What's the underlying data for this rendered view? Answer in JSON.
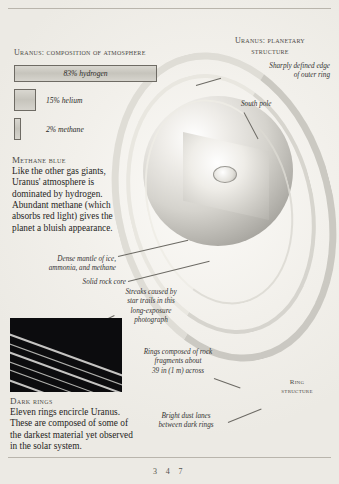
{
  "page": {
    "number": "3 4 7"
  },
  "composition": {
    "title": "Uranus: composition of atmosphere",
    "bars": [
      {
        "label": "83% hydrogen",
        "percent": 83,
        "placement": "inside"
      },
      {
        "label": "15% helium",
        "percent": 15,
        "placement": "outside"
      },
      {
        "label": "2% methane",
        "percent": 2,
        "placement": "outside"
      }
    ]
  },
  "methane_blue": {
    "heading": "Methane blue",
    "body": "Like the other gas giants, Uranus' atmosphere is dominated by hydrogen. Abundant methane (which absorbs red light) gives the planet a bluish appearance."
  },
  "structure": {
    "title_line1": "Uranus: planetary",
    "title_line2": "structure"
  },
  "ring_structure": {
    "title_line1": "Ring",
    "title_line2": "structure"
  },
  "annotations": {
    "outer_ring_edge": "Sharply defined edge\nof outer ring",
    "south_pole": "South pole",
    "mantle": "Dense mantle of ice,\nammonia, and methane",
    "core": "Solid rock core",
    "star_trails": "Streaks caused by\nstar trails in this\nlong-exposure\nphotograph",
    "ring_fragments": "Rings composed of rock\nfragments about\n39 in (1 m) across",
    "dust_lanes": "Bright dust lanes\nbetween dark rings"
  },
  "dark_rings": {
    "heading": "Dark rings",
    "body": "Eleven rings encircle Uranus. These are composed of some of the darkest material yet observed in the solar system."
  },
  "colors": {
    "paper": "#f3f1ec",
    "ink": "#262523",
    "rule": "#b9b5ac",
    "bar_fill": "#d0cec7",
    "photo_bg": "#0c0c0e"
  }
}
